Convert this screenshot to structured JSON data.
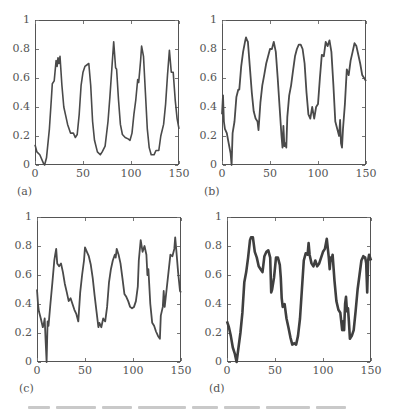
{
  "figure": {
    "caption_visible": false
  },
  "chart_data": [
    {
      "type": "line",
      "panel_label": "(a)",
      "title": "",
      "xlabel": "",
      "ylabel": "",
      "xlim": [
        0,
        150
      ],
      "ylim": [
        0,
        1
      ],
      "xticks": [
        "0",
        "50",
        "100",
        "150"
      ],
      "yticks": [
        "0",
        "0.2",
        "0.4",
        "0.6",
        "0.8",
        "1"
      ],
      "grid": false,
      "line_color": "#4a4a4a",
      "line_width": 1.6,
      "x": [
        0,
        2,
        5,
        9,
        10,
        12,
        15,
        17,
        18,
        20,
        22,
        23,
        24,
        25,
        26,
        28,
        30,
        32,
        34,
        37,
        40,
        42,
        44,
        46,
        48,
        50,
        52,
        54,
        56,
        58,
        60,
        62,
        65,
        68,
        70,
        73,
        76,
        78,
        80,
        82,
        84,
        85,
        87,
        89,
        91,
        94,
        97,
        99,
        101,
        103,
        105,
        107,
        108,
        110,
        111,
        113,
        115,
        117,
        119,
        121,
        124,
        126,
        129,
        131,
        134,
        136,
        138,
        140,
        142,
        144,
        146,
        148,
        150
      ],
      "values": [
        0.14,
        0.09,
        0.07,
        0.01,
        0,
        0.05,
        0.25,
        0.45,
        0.56,
        0.58,
        0.72,
        0.68,
        0.74,
        0.7,
        0.75,
        0.55,
        0.4,
        0.34,
        0.28,
        0.22,
        0.22,
        0.19,
        0.21,
        0.35,
        0.55,
        0.64,
        0.68,
        0.69,
        0.7,
        0.55,
        0.3,
        0.17,
        0.09,
        0.07,
        0.09,
        0.13,
        0.3,
        0.47,
        0.66,
        0.85,
        0.67,
        0.66,
        0.45,
        0.28,
        0.21,
        0.19,
        0.18,
        0.17,
        0.22,
        0.35,
        0.45,
        0.59,
        0.57,
        0.72,
        0.82,
        0.75,
        0.5,
        0.25,
        0.12,
        0.07,
        0.07,
        0.1,
        0.1,
        0.2,
        0.28,
        0.42,
        0.62,
        0.79,
        0.64,
        0.64,
        0.45,
        0.32,
        0.25
      ]
    },
    {
      "type": "line",
      "panel_label": "(b)",
      "title": "",
      "xlabel": "",
      "ylabel": "",
      "xlim": [
        0,
        150
      ],
      "ylim": [
        0,
        1
      ],
      "xticks": [
        "0",
        "50",
        "100",
        "150"
      ],
      "yticks": [
        "0",
        "0.2",
        "0.4",
        "0.6",
        "0.8",
        "1"
      ],
      "grid": false,
      "line_color": "#4a4a4a",
      "line_width": 1.8,
      "x": [
        0,
        1,
        2,
        3,
        5,
        7,
        9,
        10,
        11,
        13,
        15,
        17,
        18,
        20,
        22,
        24,
        25,
        26,
        27,
        29,
        31,
        33,
        35,
        37,
        38,
        40,
        42,
        44,
        46,
        48,
        50,
        52,
        54,
        56,
        58,
        60,
        62,
        63,
        64,
        65,
        66,
        67,
        68,
        70,
        72,
        74,
        76,
        78,
        80,
        82,
        84,
        86,
        88,
        90,
        92,
        94,
        96,
        98,
        100,
        102,
        104,
        106,
        108,
        110,
        112,
        114,
        116,
        118,
        120,
        122,
        123,
        124,
        125,
        126,
        128,
        130,
        132,
        134,
        136,
        138,
        140,
        142,
        144,
        146,
        148,
        150
      ],
      "values": [
        0.35,
        0.48,
        0.3,
        0.25,
        0.22,
        0.15,
        0.08,
        0,
        0.22,
        0.3,
        0.47,
        0.52,
        0.52,
        0.68,
        0.78,
        0.85,
        0.88,
        0.86,
        0.85,
        0.68,
        0.5,
        0.37,
        0.32,
        0.3,
        0.24,
        0.43,
        0.55,
        0.62,
        0.7,
        0.75,
        0.8,
        0.8,
        0.85,
        0.78,
        0.6,
        0.4,
        0.2,
        0.12,
        0.27,
        0.13,
        0.15,
        0.12,
        0.33,
        0.48,
        0.55,
        0.65,
        0.75,
        0.8,
        0.83,
        0.83,
        0.8,
        0.7,
        0.5,
        0.35,
        0.32,
        0.4,
        0.32,
        0.4,
        0.42,
        0.6,
        0.76,
        0.75,
        0.85,
        0.82,
        0.86,
        0.78,
        0.55,
        0.3,
        0.25,
        0.2,
        0.31,
        0.15,
        0.12,
        0.25,
        0.42,
        0.66,
        0.62,
        0.72,
        0.78,
        0.84,
        0.82,
        0.76,
        0.7,
        0.62,
        0.6,
        0.58
      ]
    },
    {
      "type": "line",
      "panel_label": "(c)",
      "title": "",
      "xlabel": "",
      "ylabel": "",
      "xlim": [
        0,
        150
      ],
      "ylim": [
        0,
        1
      ],
      "xticks": [
        "0",
        "50",
        "100",
        "150"
      ],
      "yticks": [
        "0",
        "0.2",
        "0.4",
        "0.6",
        "0.8",
        "1"
      ],
      "grid": false,
      "line_color": "#4a4a4a",
      "line_width": 1.8,
      "x": [
        0,
        1,
        2,
        4,
        6,
        7,
        8,
        9,
        10,
        11,
        12,
        14,
        16,
        18,
        19,
        20,
        21,
        23,
        25,
        27,
        29,
        31,
        33,
        35,
        37,
        39,
        41,
        43,
        45,
        47,
        49,
        50,
        52,
        54,
        56,
        58,
        60,
        62,
        64,
        65,
        67,
        69,
        71,
        73,
        75,
        77,
        79,
        81,
        82,
        83,
        85,
        87,
        89,
        91,
        93,
        95,
        97,
        99,
        101,
        103,
        105,
        106,
        108,
        110,
        112,
        114,
        115,
        116,
        118,
        120,
        122,
        124,
        126,
        128,
        129,
        131,
        132,
        133,
        135,
        137,
        139,
        141,
        143,
        144,
        145,
        147,
        149,
        150
      ],
      "values": [
        0.5,
        0.4,
        0.35,
        0.3,
        0.24,
        0.26,
        0.3,
        0.15,
        0,
        0.28,
        0.25,
        0.4,
        0.55,
        0.7,
        0.74,
        0.78,
        0.68,
        0.66,
        0.68,
        0.62,
        0.54,
        0.48,
        0.42,
        0.44,
        0.4,
        0.36,
        0.33,
        0.28,
        0.48,
        0.6,
        0.7,
        0.79,
        0.76,
        0.73,
        0.67,
        0.58,
        0.46,
        0.35,
        0.24,
        0.27,
        0.24,
        0.3,
        0.28,
        0.38,
        0.55,
        0.64,
        0.7,
        0.74,
        0.72,
        0.78,
        0.74,
        0.68,
        0.58,
        0.47,
        0.45,
        0.42,
        0.38,
        0.37,
        0.38,
        0.42,
        0.52,
        0.7,
        0.84,
        0.76,
        0.8,
        0.74,
        0.6,
        0.64,
        0.4,
        0.27,
        0.25,
        0.21,
        0.18,
        0.16,
        0.32,
        0.38,
        0.49,
        0.38,
        0.5,
        0.62,
        0.74,
        0.73,
        0.78,
        0.86,
        0.78,
        0.62,
        0.49,
        0.48
      ]
    },
    {
      "type": "line",
      "panel_label": "(d)",
      "title": "",
      "xlabel": "",
      "ylabel": "",
      "xlim": [
        0,
        150
      ],
      "ylim": [
        0,
        1
      ],
      "xticks": [
        "0",
        "50",
        "100",
        "150"
      ],
      "yticks": [
        "0",
        "0.2",
        "0.4",
        "0.6",
        "0.8",
        "1"
      ],
      "grid": false,
      "line_color": "#3f3f3f",
      "line_width": 2.6,
      "x": [
        0,
        2,
        4,
        6,
        8,
        10,
        12,
        14,
        16,
        18,
        20,
        22,
        24,
        25,
        27,
        29,
        31,
        33,
        35,
        37,
        39,
        41,
        43,
        45,
        46,
        47,
        49,
        51,
        53,
        55,
        56,
        57,
        58,
        60,
        62,
        64,
        66,
        68,
        70,
        72,
        74,
        76,
        78,
        80,
        82,
        84,
        85,
        86,
        88,
        90,
        92,
        94,
        96,
        98,
        100,
        102,
        104,
        106,
        107,
        108,
        109,
        110,
        112,
        114,
        116,
        118,
        120,
        121,
        122,
        123,
        124,
        125,
        126,
        127,
        128,
        130,
        132,
        134,
        136,
        138,
        140,
        142,
        144,
        145,
        146,
        147,
        148,
        150
      ],
      "values": [
        0.28,
        0.24,
        0.18,
        0.1,
        0.06,
        0,
        0.1,
        0.2,
        0.34,
        0.55,
        0.62,
        0.72,
        0.84,
        0.86,
        0.86,
        0.76,
        0.72,
        0.66,
        0.64,
        0.62,
        0.73,
        0.76,
        0.77,
        0.72,
        0.48,
        0.5,
        0.58,
        0.72,
        0.72,
        0.67,
        0.58,
        0.44,
        0.38,
        0.4,
        0.3,
        0.24,
        0.17,
        0.12,
        0.13,
        0.12,
        0.18,
        0.3,
        0.5,
        0.7,
        0.75,
        0.74,
        0.82,
        0.74,
        0.68,
        0.66,
        0.7,
        0.66,
        0.68,
        0.72,
        0.76,
        0.78,
        0.85,
        0.72,
        0.64,
        0.72,
        0.7,
        0.74,
        0.56,
        0.42,
        0.36,
        0.34,
        0.22,
        0.28,
        0.22,
        0.4,
        0.45,
        0.35,
        0.37,
        0.28,
        0.16,
        0.18,
        0.22,
        0.35,
        0.5,
        0.6,
        0.7,
        0.73,
        0.72,
        0.68,
        0.48,
        0.7,
        0.74,
        0.7
      ]
    }
  ]
}
